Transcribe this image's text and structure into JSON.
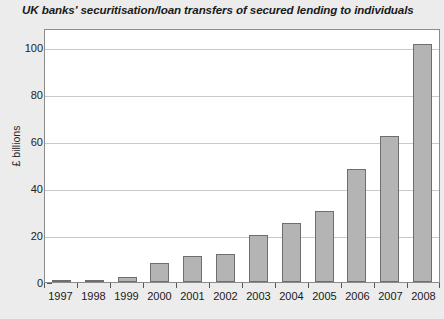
{
  "chart_data": {
    "type": "bar",
    "title": "UK banks' securitisation/loan transfers of secured lending to individuals",
    "xlabel": "",
    "ylabel": "£ billions",
    "categories": [
      "1997",
      "1998",
      "1999",
      "2000",
      "2001",
      "2002",
      "2003",
      "2004",
      "2005",
      "2006",
      "2007",
      "2008"
    ],
    "values": [
      0.5,
      0.7,
      2,
      8,
      11,
      12,
      20,
      25,
      30,
      48,
      62,
      101
    ],
    "ylim": [
      0,
      108
    ],
    "yticks": [
      0,
      20,
      40,
      60,
      80,
      100
    ],
    "ytick_labels": [
      "0",
      "20",
      "40",
      "60",
      "80",
      "100"
    ],
    "grid": true,
    "legend": false,
    "series": [
      {
        "name": "Securitisation/loan transfers",
        "values": [
          0.5,
          0.7,
          2,
          8,
          11,
          12,
          20,
          25,
          30,
          48,
          62,
          101
        ]
      }
    ],
    "colors": {
      "bar_fill": "#b4b4b4",
      "bar_border": "#6e6e6e",
      "plot_background": "#ffffff",
      "page_background": "#ececec",
      "gridline": "#c9c9c9",
      "axis": "#8c8c8c",
      "text": "#1a1a1a"
    }
  }
}
